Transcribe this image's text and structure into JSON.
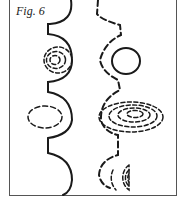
{
  "figure": {
    "caption": "Fig. 6",
    "stroke_color": "#1a1a1a",
    "frame_color": "#555555",
    "left_column": {
      "style": "solid wavy line with semicircular bulges",
      "enclosed_shapes": [
        {
          "type": "concentric dashed ellipses",
          "rings": 3
        },
        {
          "type": "dashed ellipse",
          "rings": 1
        }
      ]
    },
    "right_column": {
      "style": "dashed wavy line",
      "enclosed_shapes": [
        {
          "type": "solid circle",
          "rings": 1
        },
        {
          "type": "concentric dashed ellipses",
          "rings": 4
        },
        {
          "type": "concentric dashed semicircles",
          "rings": 3
        }
      ]
    }
  }
}
